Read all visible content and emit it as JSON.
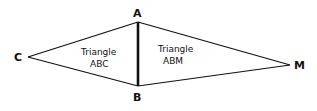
{
  "diagram": {
    "vertices": {
      "A": {
        "label": "A",
        "x": 138,
        "y": 22
      },
      "B": {
        "label": "B",
        "x": 138,
        "y": 86
      },
      "C": {
        "label": "C",
        "x": 28,
        "y": 57
      },
      "M": {
        "label": "M",
        "x": 290,
        "y": 65
      }
    },
    "triangles": [
      {
        "name": "Triangle ABC",
        "line1": "Triangle",
        "line2": "ABC"
      },
      {
        "name": "Triangle ABM",
        "line1": "Triangle",
        "line2": "ABM"
      }
    ],
    "colors": {
      "stroke": "#111111",
      "background": "#ffffff"
    }
  }
}
